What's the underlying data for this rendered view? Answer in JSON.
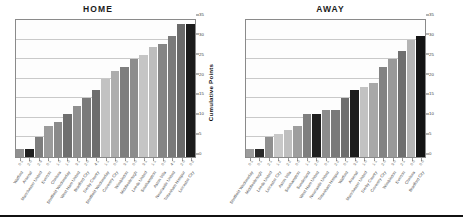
{
  "figure": {
    "footer_rule": true
  },
  "chart_data": [
    {
      "type": "bar",
      "title": "HOME",
      "xlabel": "",
      "ylabel": "Cumulative Points",
      "ylim": [
        0,
        35
      ],
      "yticks": [
        0,
        5,
        10,
        15,
        20,
        25,
        30,
        35
      ],
      "grid": true,
      "legend": "none",
      "categories": [
        "Watford",
        "Arsenal",
        "Manchester United",
        "Everton",
        "Chelsea",
        "Sheffield Wednesday",
        "West Ham United",
        "Bradford City",
        "Derby County",
        "Sheffield Wednesday",
        "Coventry City",
        "Wimbledon",
        "Middlesbrough",
        "Leeds United",
        "Southampton",
        "Aston Villa",
        "Newcastle United",
        "Tottenham Hotspur",
        "Leicester City"
      ],
      "scores": [
        "0-1",
        "2-0",
        "2-3",
        "0-1",
        "1-0",
        "1-0",
        "3-1",
        "2-0",
        "4-1",
        "1-1",
        "0-0",
        "3-1",
        "0-0",
        "3-1",
        "1-1",
        "0-0",
        "4-1",
        "2-0",
        "0-2"
      ],
      "values": [
        2,
        2,
        5,
        8,
        9,
        11,
        13,
        15,
        17,
        20,
        22,
        23,
        25,
        26,
        28,
        29,
        31,
        34,
        34
      ],
      "bar_shades": [
        "#8f8f8f",
        "#1f1f1f",
        "#7d7d7d",
        "#9b9b9b",
        "#8a8a8a",
        "#6f6f6f",
        "#8f8f8f",
        "#7a7a7a",
        "#6d6d6d",
        "#c2c2c2",
        "#adadad",
        "#7e7e7e",
        "#8d8d8d",
        "#c5c5c5",
        "#bdbdbd",
        "#858585",
        "#7a7a7a",
        "#6a6a6a",
        "#1c1c1c"
      ]
    },
    {
      "type": "bar",
      "title": "AWAY",
      "xlabel": "",
      "ylabel": "",
      "ylim": [
        0,
        35
      ],
      "yticks": [
        0,
        5,
        10,
        15,
        20,
        25,
        30,
        35
      ],
      "grid": true,
      "legend": "none",
      "categories": [
        "Sheffield Wednesday",
        "Middlesbrough",
        "Leeds United",
        "Leicester City",
        "Aston Villa",
        "Southampton",
        "Sunderland",
        "West Ham United",
        "Newcastle United",
        "Tottenham Hotspur",
        "Watford",
        "Arsenal",
        "Manchester United",
        "Derby County",
        "Coventry City",
        "Wimbledon",
        "Everton",
        "Chelsea",
        "Bradford City"
      ],
      "scores": [
        "0-1",
        "0-1",
        "2-1",
        "1-2",
        "2-2",
        "0-0",
        "1-1",
        "2-0",
        "0-1",
        "2-2",
        "0-1",
        "3-2",
        "1-0",
        "1-1",
        "2-0",
        "3-0",
        "2-1",
        "0-0",
        "0-0"
      ],
      "values": [
        2,
        2,
        5,
        6,
        7,
        8,
        11,
        11,
        12,
        12,
        15,
        17,
        18,
        19,
        23,
        25,
        27,
        30,
        31
      ],
      "bar_shades": [
        "#9b9b9b",
        "#2a2a2a",
        "#8f8f8f",
        "#c8c8c8",
        "#bfbfbf",
        "#9e9e9e",
        "#7f7f7f",
        "#1f1f1f",
        "#8c8c8c",
        "#7a7a7a",
        "#6e6e6e",
        "#1c1c1c",
        "#c2c2c2",
        "#a8a8a8",
        "#838383",
        "#999999",
        "#6f6f6f",
        "#b4b4b4",
        "#141414"
      ]
    }
  ]
}
